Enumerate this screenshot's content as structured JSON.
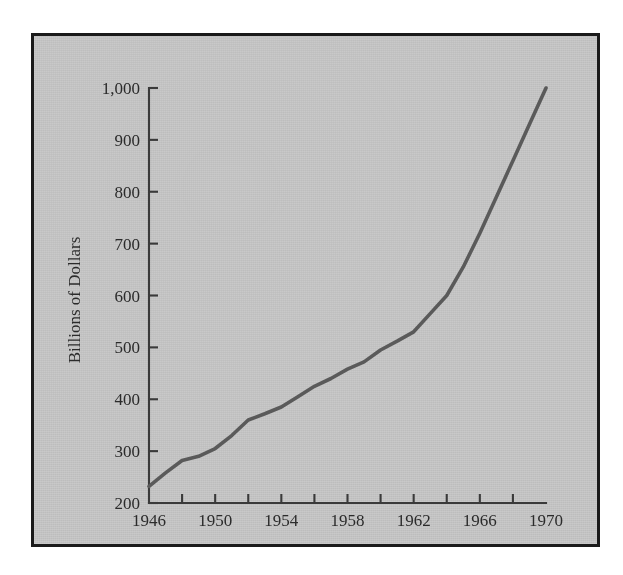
{
  "figure": {
    "frame_color": "#1a1a1a",
    "background_color": "#c9c9c9",
    "line_color": "#5a5a5a",
    "axis_color": "#3a3a3a"
  },
  "chart_data": {
    "type": "line",
    "title": "",
    "subtitle": "",
    "xlabel": "",
    "ylabel": "Billions of Dollars",
    "xlim": [
      1946,
      1970
    ],
    "ylim": [
      200,
      1000
    ],
    "grid": false,
    "legend": null,
    "legend_position": "none",
    "x_tick_labels": [
      "1946",
      "1950",
      "1954",
      "1958",
      "1962",
      "1966",
      "1970"
    ],
    "x_tick_values": [
      1946,
      1950,
      1954,
      1958,
      1962,
      1966,
      1970
    ],
    "x_minor_tick_values": [
      1948,
      1952,
      1956,
      1960,
      1964,
      1968
    ],
    "y_tick_labels": [
      "200",
      "300",
      "400",
      "500",
      "600",
      "700",
      "800",
      "900",
      "1,000"
    ],
    "y_tick_values": [
      200,
      300,
      400,
      500,
      600,
      700,
      800,
      900,
      1000
    ],
    "series": [
      {
        "name": "Billions of Dollars",
        "color": "#5a5a5a",
        "x": [
          1946,
          1947,
          1948,
          1949,
          1950,
          1951,
          1952,
          1953,
          1954,
          1955,
          1956,
          1957,
          1958,
          1959,
          1960,
          1961,
          1962,
          1963,
          1964,
          1965,
          1966,
          1967,
          1968,
          1969,
          1970
        ],
        "values": [
          232,
          258,
          282,
          290,
          305,
          330,
          360,
          372,
          385,
          405,
          425,
          440,
          458,
          472,
          495,
          512,
          530,
          565,
          600,
          655,
          720,
          790,
          860,
          930,
          1000
        ]
      }
    ],
    "annotations": []
  },
  "axis": {
    "y_title": "Billions of Dollars"
  }
}
